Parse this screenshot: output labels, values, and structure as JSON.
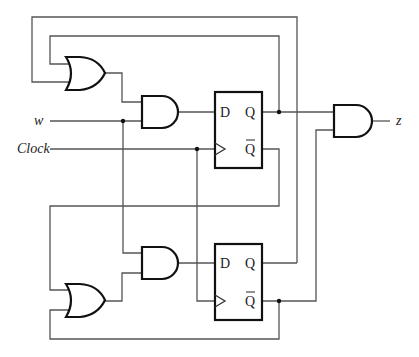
{
  "diagram": {
    "type": "sequential-circuit",
    "inputs": {
      "w": "w",
      "clock": "Clock"
    },
    "output": {
      "z": "z"
    },
    "flipflops": [
      {
        "d": "D",
        "q": "Q",
        "qbar": "Q",
        "name": "FF1"
      },
      {
        "d": "D",
        "q": "Q",
        "qbar": "Q",
        "name": "FF2"
      }
    ],
    "gates": [
      "OR1",
      "AND1",
      "AND2",
      "OR2",
      "AND-out"
    ]
  }
}
